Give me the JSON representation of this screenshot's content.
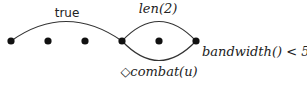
{
  "diagram": {
    "nodes": [
      {
        "id": "n1",
        "x": 11,
        "y": 41
      },
      {
        "id": "n2",
        "x": 48,
        "y": 41
      },
      {
        "id": "n3",
        "x": 85,
        "y": 41
      },
      {
        "id": "n4",
        "x": 122,
        "y": 41
      },
      {
        "id": "n5",
        "x": 159,
        "y": 41
      },
      {
        "id": "n6",
        "x": 196,
        "y": 41
      }
    ],
    "edges": [
      {
        "from": "n1",
        "to": "n4",
        "label": "true",
        "side": "top"
      },
      {
        "from": "n4",
        "to": "n6",
        "label": "len(2)",
        "side": "top"
      },
      {
        "from": "n4",
        "to": "n6",
        "label": "◇combat(u)",
        "side": "bottom"
      }
    ],
    "labels": {
      "true": "true",
      "len": "len(2)",
      "combat": "◇combat(u)",
      "bandwidth": "bandwidth() < 50"
    }
  }
}
